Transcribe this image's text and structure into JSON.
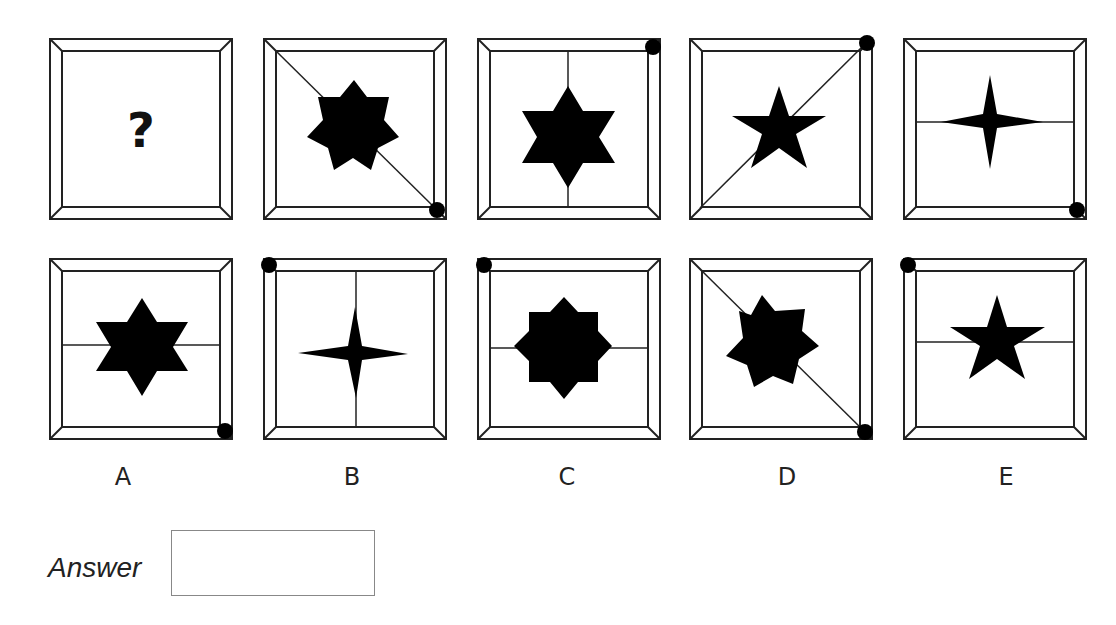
{
  "puzzle": {
    "question_cell": {
      "symbol": "?"
    },
    "sequence": [
      {
        "shape": "8-point-star",
        "line": "diagonal-tl-br",
        "dot": "bottom-right"
      },
      {
        "shape": "6-point-star",
        "line": "vertical",
        "dot": "top-right"
      },
      {
        "shape": "5-point-star",
        "line": "diagonal-bl-tr",
        "dot": "top-right"
      },
      {
        "shape": "4-point-star",
        "line": "horizontal",
        "dot": "bottom-right"
      }
    ],
    "options": [
      {
        "label": "A",
        "shape": "6-point-star",
        "line": "horizontal",
        "dot": "bottom-right"
      },
      {
        "label": "B",
        "shape": "4-point-star",
        "line": "vertical",
        "dot": "top-left"
      },
      {
        "label": "C",
        "shape": "8-point-star",
        "line": "horizontal",
        "dot": "top-left"
      },
      {
        "label": "D",
        "shape": "8-point-star",
        "line": "diagonal-tl-br",
        "dot": "bottom-right"
      },
      {
        "label": "E",
        "shape": "5-point-star",
        "line": "horizontal",
        "dot": "top-left"
      }
    ]
  },
  "answer": {
    "label": "Answer",
    "value": ""
  }
}
